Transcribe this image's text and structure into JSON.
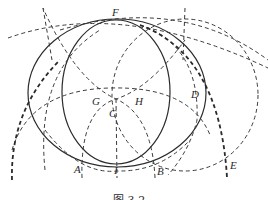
{
  "figure": {
    "caption": "图 3-2",
    "colors": {
      "stroke": "#2b2b2b",
      "background": "#ffffff"
    },
    "points": [
      {
        "name": "F",
        "x": 116,
        "y": 19,
        "lx": 112,
        "ly": 16
      },
      {
        "name": "G",
        "x": 100,
        "y": 99,
        "lx": 92,
        "ly": 105
      },
      {
        "name": "H",
        "x": 135,
        "y": 99,
        "lx": 135,
        "ly": 105
      },
      {
        "name": "C",
        "x": 116,
        "y": 99,
        "lx": 109,
        "ly": 117
      },
      {
        "name": "D",
        "x": 189,
        "y": 95,
        "lx": 191,
        "ly": 98
      },
      {
        "name": "A",
        "x": 82,
        "y": 165,
        "lx": 74,
        "ly": 173
      },
      {
        "name": "I",
        "x": 117,
        "y": 165,
        "lx": 114,
        "ly": 174
      },
      {
        "name": "B",
        "x": 155,
        "y": 163,
        "lx": 157,
        "ly": 175
      },
      {
        "name": "E",
        "x": 227,
        "y": 161,
        "lx": 230,
        "ly": 169
      }
    ],
    "solid_circles": [
      {
        "name": "outer-solid-circle",
        "cx": 117,
        "cy": 93,
        "rx": 89,
        "ry": 74
      },
      {
        "name": "inner-solid-circle",
        "cx": 116,
        "cy": 92,
        "rx": 54,
        "ry": 72
      }
    ]
  }
}
